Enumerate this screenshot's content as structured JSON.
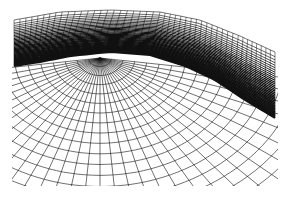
{
  "image": {
    "width": 289,
    "height": 200,
    "background": "#ffffff",
    "ink": "#111111",
    "description": "Wireframe mesh illustration of a curved surface: dense horizontal band at top sweeping down to the right, over a radial polar grid fanning out from a focal point"
  },
  "polar_grid": {
    "center": [
      100,
      58
    ],
    "rings": 22,
    "ring_step": 9,
    "spokes": 34,
    "angle_start_deg": 8,
    "angle_end_deg": 172,
    "stroke_width": 0.6
  },
  "dense_band": {
    "top_edge": [
      [
        14,
        20
      ],
      [
        60,
        12
      ],
      [
        110,
        10
      ],
      [
        160,
        12
      ],
      [
        200,
        20
      ],
      [
        240,
        36
      ],
      [
        275,
        52
      ]
    ],
    "bottom_edge": [
      [
        275,
        118
      ],
      [
        245,
        100
      ],
      [
        215,
        80
      ],
      [
        185,
        66
      ],
      [
        150,
        55
      ],
      [
        110,
        52
      ],
      [
        70,
        56
      ],
      [
        40,
        62
      ],
      [
        14,
        66
      ]
    ],
    "line_count": 34,
    "cross_lines": 46
  }
}
